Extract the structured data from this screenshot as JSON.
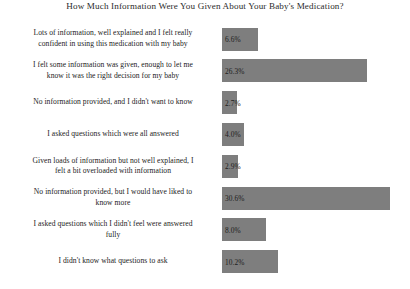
{
  "chart_data": {
    "type": "bar",
    "orientation": "horizontal",
    "title": "How Much Information Were You Given About Your Baby's Medication?",
    "xlabel": "",
    "ylabel": "",
    "xlim": [
      0,
      32
    ],
    "grid": false,
    "legend": false,
    "bar_color": "#7e7e7e",
    "value_suffix": "%",
    "categories": [
      "Lots of information, well explained and I felt really confident in using this medication with my baby",
      "I felt some information was given, enough to let me know it was the right decision for my baby",
      "No information provided, and I didn't want to know",
      "I asked questions which were all answered",
      "Given loads of information but not well explained, I felt a bit overloaded with information",
      "No information provided, but I would have liked to know more",
      "I asked questions which I didn't feel were answered fully",
      "I didn't know what questions to ask"
    ],
    "values": [
      6.6,
      26.3,
      2.7,
      4.0,
      2.9,
      30.6,
      8.0,
      10.2
    ],
    "value_labels": [
      "6.6%",
      "26.3%",
      "2.7%",
      "4.0%",
      "2.9%",
      "30.6%",
      "8.0%",
      "10.2%"
    ],
    "rows": [
      {
        "label_lines": [
          "Lots of information, well explained and I felt really",
          "confident in using this medication with my baby"
        ],
        "value": 6.6,
        "value_label": "6.6%"
      },
      {
        "label_lines": [
          "I felt some information was given, enough to let me",
          "know it was the right decision for my baby"
        ],
        "value": 26.3,
        "value_label": "26.3%"
      },
      {
        "label_lines": [
          "No information provided, and I didn't want to know"
        ],
        "value": 2.7,
        "value_label": "2.7%"
      },
      {
        "label_lines": [
          "I asked questions which were all answered"
        ],
        "value": 4.0,
        "value_label": "4.0%"
      },
      {
        "label_lines": [
          "Given loads of information but not well explained, I",
          "felt a bit overloaded with information"
        ],
        "value": 2.9,
        "value_label": "2.9%"
      },
      {
        "label_lines": [
          "No information provided, but I would have liked to",
          "know more"
        ],
        "value": 30.6,
        "value_label": "30.6%"
      },
      {
        "label_lines": [
          "I asked questions which I didn't feel were answered",
          "fully"
        ],
        "value": 8.0,
        "value_label": "8.0%"
      },
      {
        "label_lines": [
          "I didn't know what questions to ask"
        ],
        "value": 10.2,
        "value_label": "10.2%"
      }
    ]
  }
}
